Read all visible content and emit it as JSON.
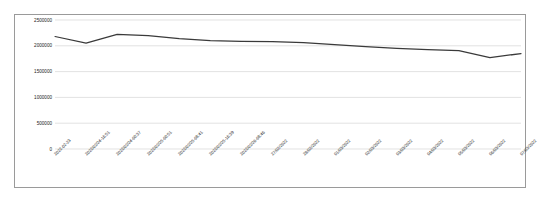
{
  "chart_data": {
    "type": "line",
    "title": "",
    "xlabel": "",
    "ylabel": "",
    "ylim": [
      0,
      2500000
    ],
    "yticks": [
      0,
      500000,
      1000000,
      1500000,
      2000000,
      2500000
    ],
    "ytick_labels": [
      "0",
      "500000",
      "1000000",
      "1500000",
      "2000000",
      "2500000"
    ],
    "grid": true,
    "legend": false,
    "line_color": "#3a3a3a",
    "categories": [
      "2022-02-23",
      "2022/02/24-16:51",
      "2022/02/24-00:37",
      "2022/02/25-00:51",
      "2022/02/25-08:41",
      "2022/02/25-16:39",
      "2022/02/26-08:46",
      "27/02/2022",
      "28/02/2022",
      "01/03/2022",
      "02/03/2022",
      "03/03/2022",
      "04/03/2022",
      "05/03/2022",
      "06/03/2022",
      "07/03/2022"
    ],
    "series": [
      {
        "name": "value",
        "values": [
          2180000,
          2050000,
          2220000,
          2195000,
          2140000,
          2100000,
          2085000,
          2080000,
          2060000,
          2025000,
          1985000,
          1950000,
          1925000,
          1905000,
          1770000,
          1850000
        ]
      }
    ]
  }
}
